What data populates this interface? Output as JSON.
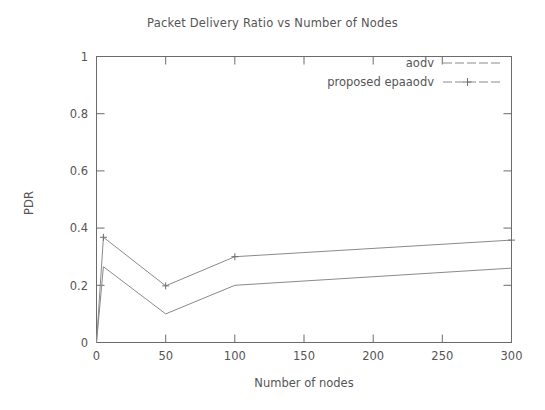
{
  "chart_data": {
    "type": "line",
    "title": "Packet Delivery Ratio vs Number of Nodes",
    "xlabel": "Number of nodes",
    "ylabel": "PDR",
    "xlim": [
      0,
      300
    ],
    "ylim": [
      0,
      1
    ],
    "xticks": [
      0,
      50,
      100,
      150,
      200,
      250,
      300
    ],
    "xtick_labels": [
      "0",
      "50",
      "100",
      "150",
      "200",
      "250",
      "300"
    ],
    "yticks": [
      0,
      0.2,
      0.4,
      0.6,
      0.8,
      1
    ],
    "ytick_labels": [
      "0",
      "0.2",
      "0.4",
      "0.6",
      "0.8",
      "1"
    ],
    "grid": false,
    "legend_position": "top-right",
    "x": [
      0,
      5,
      50,
      100,
      300
    ],
    "series": [
      {
        "name": "aodv",
        "marker": "none",
        "values": [
          0.0,
          0.265,
          0.1,
          0.2,
          0.26
        ]
      },
      {
        "name": "proposed epaaodv",
        "marker": "plus",
        "values": [
          0.0,
          0.368,
          0.198,
          0.3,
          0.358
        ]
      }
    ]
  },
  "legend": {
    "entries": [
      {
        "label": "aodv",
        "marker": "none"
      },
      {
        "label": "proposed epaaodv",
        "marker": "plus"
      }
    ]
  },
  "colors": {
    "line": "#8a8a8a",
    "axis": "#6b6b6b",
    "text": "#555555",
    "background": "#ffffff"
  }
}
